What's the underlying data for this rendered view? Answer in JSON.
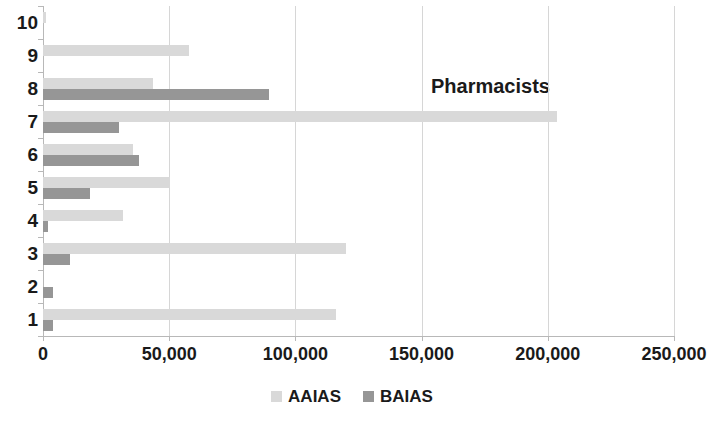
{
  "chart_data": {
    "type": "bar",
    "orientation": "horizontal",
    "title": "Pharmacists",
    "xlabel": "",
    "ylabel": "",
    "categories": [
      "1",
      "2",
      "3",
      "4",
      "5",
      "6",
      "7",
      "8",
      "9",
      "10"
    ],
    "series": [
      {
        "name": "AAIAS",
        "color": "#d9d9d9",
        "values": [
          116000,
          0,
          120000,
          31500,
          50500,
          35500,
          203500,
          43500,
          58000,
          1200
        ]
      },
      {
        "name": "BAIAS",
        "color": "#969696",
        "values": [
          4000,
          4000,
          10500,
          2000,
          18500,
          38000,
          30000,
          89500,
          0,
          0
        ]
      }
    ],
    "xlim": [
      0,
      250000
    ],
    "xticks": [
      0,
      50000,
      100000,
      150000,
      200000,
      250000
    ],
    "xtick_labels": [
      "0",
      "50,000",
      "100,000",
      "150,000",
      "200,000",
      "250,000"
    ],
    "grid": "vertical",
    "legend_position": "bottom"
  },
  "legend": {
    "items": [
      {
        "label": "AAIAS",
        "swatch": "#d9d9d9"
      },
      {
        "label": "BAIAS",
        "swatch": "#969696"
      }
    ]
  }
}
